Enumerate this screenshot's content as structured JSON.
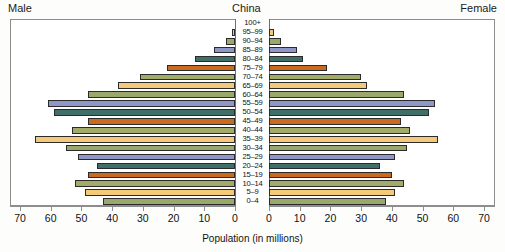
{
  "header": {
    "left_label": "Male",
    "center_label": "China",
    "right_label": "Female"
  },
  "axis": {
    "title": "Population (in millions)",
    "tick_labels_left": [
      "70",
      "60",
      "50",
      "40",
      "30",
      "20",
      "10",
      "0"
    ],
    "tick_labels_right": [
      "0",
      "10",
      "20",
      "30",
      "40",
      "50",
      "60",
      "70"
    ],
    "max": 70,
    "step": 10
  },
  "palette": {
    "cycle": [
      "#a3ab6a",
      "#f5c97a",
      "#9aa86b",
      "#8f97c8",
      "#3f6f68",
      "#c96a1e"
    ],
    "bar_outline": "#2b2b2b",
    "frame": "#8d8d8d",
    "background": "#ffffff",
    "page_background": "#fdfdfb",
    "text": "#111111"
  },
  "chart_data": {
    "type": "bar",
    "title": "China",
    "subtitle": "",
    "xlabel": "Population (in millions)",
    "ylabel": "",
    "xlim": [
      0,
      70
    ],
    "grid": false,
    "legend_position": "none",
    "orientation": "horizontal-diverging",
    "categories": [
      "100+",
      "95–99",
      "90–94",
      "85–89",
      "80–84",
      "75–79",
      "70–74",
      "65–69",
      "60–64",
      "55–59",
      "50–54",
      "45–49",
      "40–44",
      "35–39",
      "30–34",
      "25–29",
      "20–24",
      "15–19",
      "10–14",
      "5–9",
      "0–4"
    ],
    "series": [
      {
        "name": "Male",
        "side": "left",
        "values": [
          0,
          1,
          3,
          7,
          13,
          22,
          31,
          38,
          48,
          61,
          59,
          48,
          53,
          65,
          55,
          51,
          45,
          48,
          52,
          49,
          43
        ]
      },
      {
        "name": "Female",
        "side": "right",
        "values": [
          0,
          1.5,
          4,
          9,
          11,
          19,
          30,
          32,
          44,
          54,
          52,
          43,
          46,
          55,
          45,
          41,
          36,
          40,
          44,
          41,
          38
        ]
      }
    ],
    "bar_colors": [
      "#a3ab6a",
      "#f5c97a",
      "#9aa86b",
      "#8f97c8",
      "#3f6f68",
      "#c96a1e",
      "#a3ab6a",
      "#f5c97a",
      "#9aa86b",
      "#8f97c8",
      "#3f6f68",
      "#c96a1e",
      "#a3ab6a",
      "#f5c97a",
      "#9aa86b",
      "#8f97c8",
      "#3f6f68",
      "#c96a1e",
      "#a3ab6a",
      "#f5c97a",
      "#9aa86b"
    ]
  }
}
